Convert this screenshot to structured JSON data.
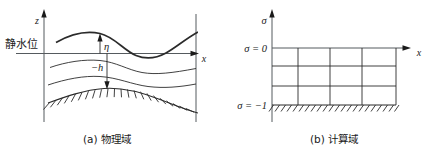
{
  "figure": {
    "panels": [
      {
        "id": "physical-domain",
        "caption": "(a) 物理域",
        "axis_vertical_label": "z",
        "axis_horizontal_label": "x",
        "labels": {
          "still_water_level": "静水位",
          "surface_elevation": "η",
          "depth": "−h"
        }
      },
      {
        "id": "computational-domain",
        "caption": "(b) 计算域",
        "axis_vertical_label": "σ",
        "axis_horizontal_label": "x",
        "labels": {
          "sigma_top": "σ = 0",
          "sigma_bottom": "σ = −1"
        }
      }
    ],
    "colors": {
      "ink": "#1a1a1a",
      "curve": "#2b2b2b",
      "axis": "#555a5e",
      "background": "#ffffff"
    }
  }
}
